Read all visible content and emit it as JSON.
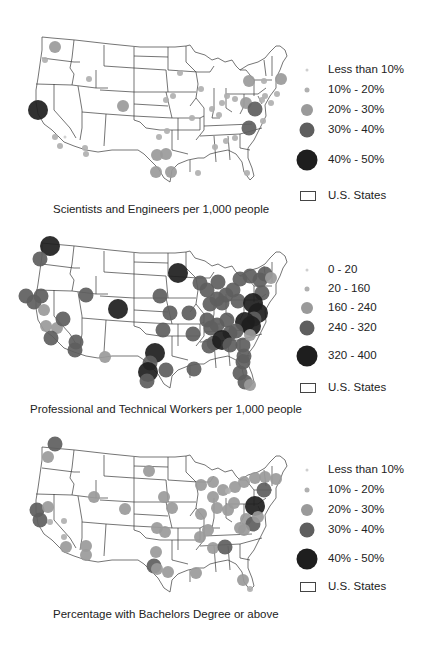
{
  "colors": {
    "state_line": "#3a3a3a",
    "level1": "#cfcfcf",
    "level2": "#b0b0b0",
    "level3": "#9a9a9a",
    "level4": "#5e5e5e",
    "level5": "#1e1e1e"
  },
  "panels": [
    {
      "caption": "Scientists and Engineers per 1,000 people",
      "legend": {
        "items": [
          {
            "label": "Less than 10%",
            "r": 1.5,
            "color": "#cfcfcf"
          },
          {
            "label": "10% - 20%",
            "r": 2.5,
            "color": "#b0b0b0"
          },
          {
            "label": "20% - 30%",
            "r": 6,
            "color": "#9a9a9a"
          },
          {
            "label": "30% - 40%",
            "r": 7.5,
            "color": "#5e5e5e"
          },
          {
            "label": "40% - 50%",
            "r": 10.5,
            "color": "#1e1e1e"
          }
        ],
        "states_label": "U.S. States"
      },
      "points": [
        [
          55,
          47,
          6,
          3
        ],
        [
          45,
          60,
          3,
          2
        ],
        [
          38,
          110,
          10,
          5
        ],
        [
          55,
          137,
          3,
          2
        ],
        [
          65,
          137,
          1.5,
          1
        ],
        [
          60,
          146,
          3,
          2
        ],
        [
          89,
          79,
          3,
          2
        ],
        [
          123,
          106,
          6,
          3
        ],
        [
          85,
          148,
          3,
          2
        ],
        [
          86,
          154,
          3,
          2
        ],
        [
          180,
          73,
          3,
          2
        ],
        [
          201,
          89,
          3,
          2
        ],
        [
          166,
          100,
          3,
          2
        ],
        [
          192,
          118,
          3,
          2
        ],
        [
          173,
          96,
          3,
          2
        ],
        [
          212,
          109,
          3,
          2
        ],
        [
          222,
          103,
          3,
          2
        ],
        [
          227,
          96,
          3,
          2
        ],
        [
          219,
          115,
          3,
          2
        ],
        [
          235,
          99,
          3,
          2
        ],
        [
          249,
          81,
          6,
          3
        ],
        [
          264,
          81,
          3,
          2
        ],
        [
          281,
          79,
          6,
          3
        ],
        [
          265,
          96,
          3,
          2
        ],
        [
          262,
          100,
          3,
          2
        ],
        [
          246,
          103,
          6,
          3
        ],
        [
          255,
          109,
          7.5,
          4
        ],
        [
          249,
          128,
          7.5,
          4
        ],
        [
          263,
          121,
          3,
          2
        ],
        [
          235,
          138,
          3,
          2
        ],
        [
          215,
          147,
          3,
          2
        ],
        [
          226,
          141,
          3,
          2
        ],
        [
          159,
          137,
          3,
          2
        ],
        [
          167,
          131,
          3,
          2
        ],
        [
          157,
          155,
          6,
          3
        ],
        [
          166,
          154,
          6,
          3
        ],
        [
          156,
          172,
          6,
          3
        ],
        [
          171,
          172,
          6,
          3
        ],
        [
          198,
          173,
          3,
          2
        ],
        [
          247,
          173,
          3,
          2
        ],
        [
          277,
          94,
          3,
          2
        ],
        [
          271,
          103,
          3,
          2
        ]
      ]
    },
    {
      "caption": "Professional and Technical Workers per 1,000 people",
      "legend": {
        "items": [
          {
            "label": "0 - 20",
            "r": 1.5,
            "color": "#cfcfcf"
          },
          {
            "label": "20 - 160",
            "r": 2.5,
            "color": "#b0b0b0"
          },
          {
            "label": "160 - 240",
            "r": 6,
            "color": "#9a9a9a"
          },
          {
            "label": "240 - 320",
            "r": 7.5,
            "color": "#5e5e5e"
          },
          {
            "label": "320 - 400",
            "r": 10.5,
            "color": "#1e1e1e"
          }
        ],
        "states_label": "U.S. States"
      },
      "points": [
        [
          50,
          246,
          10,
          5
        ],
        [
          40,
          259,
          7.5,
          4
        ],
        [
          26,
          296,
          7.5,
          4
        ],
        [
          34,
          302,
          7.5,
          4
        ],
        [
          41,
          296,
          7.5,
          4
        ],
        [
          44,
          310,
          6,
          3
        ],
        [
          46,
          326,
          6,
          3
        ],
        [
          57,
          328,
          6,
          3
        ],
        [
          51,
          338,
          7.5,
          4
        ],
        [
          63,
          319,
          7.5,
          4
        ],
        [
          76,
          342,
          7.5,
          4
        ],
        [
          75,
          350,
          7.5,
          4
        ],
        [
          86,
          295,
          7.5,
          4
        ],
        [
          105,
          357,
          6,
          3
        ],
        [
          118,
          309,
          10,
          5
        ],
        [
          178,
          273,
          10,
          5
        ],
        [
          160,
          296,
          7.5,
          4
        ],
        [
          170,
          313,
          7.5,
          4
        ],
        [
          189,
          313,
          7.5,
          4
        ],
        [
          193,
          334,
          7.5,
          4
        ],
        [
          163,
          330,
          7.5,
          4
        ],
        [
          155,
          353,
          10,
          5
        ],
        [
          150,
          363,
          7.5,
          4
        ],
        [
          148,
          372,
          10,
          5
        ],
        [
          147,
          381,
          7.5,
          4
        ],
        [
          166,
          370,
          7.5,
          4
        ],
        [
          194,
          369,
          7.5,
          4
        ],
        [
          200,
          283,
          7.5,
          4
        ],
        [
          207,
          290,
          7.5,
          4
        ],
        [
          218,
          282,
          7.5,
          4
        ],
        [
          217,
          299,
          7.5,
          4
        ],
        [
          210,
          304,
          7.5,
          4
        ],
        [
          222,
          303,
          7.5,
          4
        ],
        [
          226,
          295,
          7.5,
          4
        ],
        [
          233,
          290,
          7.5,
          4
        ],
        [
          238,
          301,
          7.5,
          4
        ],
        [
          207,
          320,
          7.5,
          4
        ],
        [
          217,
          325,
          7.5,
          4
        ],
        [
          227,
          320,
          7.5,
          4
        ],
        [
          230,
          333,
          7.5,
          4
        ],
        [
          211,
          328,
          7.5,
          4
        ],
        [
          214,
          343,
          7.5,
          4
        ],
        [
          209,
          346,
          7.5,
          4
        ],
        [
          222,
          340,
          10,
          5
        ],
        [
          230,
          345,
          7.5,
          4
        ],
        [
          243,
          345,
          7.5,
          4
        ],
        [
          240,
          279,
          7.5,
          4
        ],
        [
          250,
          276,
          7.5,
          4
        ],
        [
          260,
          280,
          7.5,
          4
        ],
        [
          265,
          274,
          7.5,
          4
        ],
        [
          271,
          278,
          6,
          3
        ],
        [
          262,
          293,
          7.5,
          4
        ],
        [
          253,
          303,
          10,
          5
        ],
        [
          258,
          313,
          10,
          5
        ],
        [
          254,
          319,
          7.5,
          4
        ],
        [
          245,
          322,
          10,
          5
        ],
        [
          251,
          326,
          10,
          5
        ],
        [
          236,
          331,
          7.5,
          4
        ],
        [
          250,
          335,
          6,
          3
        ],
        [
          243,
          362,
          7.5,
          4
        ],
        [
          240,
          373,
          7.5,
          4
        ],
        [
          245,
          382,
          7.5,
          4
        ],
        [
          250,
          385,
          6,
          3
        ],
        [
          244,
          356,
          7.5,
          4
        ]
      ]
    },
    {
      "caption": "Percentage with Bachelors Degree or above",
      "legend": {
        "items": [
          {
            "label": "Less than 10%",
            "r": 1.5,
            "color": "#cfcfcf"
          },
          {
            "label": "10% - 20%",
            "r": 2.5,
            "color": "#b0b0b0"
          },
          {
            "label": "20% - 30%",
            "r": 6,
            "color": "#9a9a9a"
          },
          {
            "label": "30% - 40%",
            "r": 7.5,
            "color": "#5e5e5e"
          },
          {
            "label": "40% - 50%",
            "r": 10.5,
            "color": "#1e1e1e"
          }
        ],
        "states_label": "U.S. States"
      },
      "points": [
        [
          55,
          444,
          7.5,
          4
        ],
        [
          48,
          457,
          6,
          3
        ],
        [
          37,
          510,
          7.5,
          4
        ],
        [
          40,
          520,
          7.5,
          4
        ],
        [
          48,
          507,
          6,
          3
        ],
        [
          50,
          522,
          3,
          2
        ],
        [
          64,
          521,
          3,
          2
        ],
        [
          64,
          537,
          3,
          2
        ],
        [
          66,
          547,
          6,
          3
        ],
        [
          86,
          546,
          6,
          3
        ],
        [
          86,
          555,
          6,
          3
        ],
        [
          94,
          497,
          6,
          3
        ],
        [
          125,
          509,
          6,
          3
        ],
        [
          149,
          471,
          6,
          3
        ],
        [
          164,
          497,
          6,
          3
        ],
        [
          172,
          508,
          6,
          3
        ],
        [
          157,
          528,
          6,
          3
        ],
        [
          165,
          532,
          6,
          3
        ],
        [
          156,
          552,
          6,
          3
        ],
        [
          154,
          566,
          7.5,
          4
        ],
        [
          157,
          569,
          6,
          3
        ],
        [
          168,
          572,
          6,
          3
        ],
        [
          196,
          573,
          6,
          3
        ],
        [
          201,
          514,
          6,
          3
        ],
        [
          200,
          537,
          6,
          3
        ],
        [
          213,
          497,
          6,
          3
        ],
        [
          213,
          482,
          6,
          3
        ],
        [
          201,
          485,
          6,
          3
        ],
        [
          223,
          490,
          6,
          3
        ],
        [
          235,
          487,
          6,
          3
        ],
        [
          217,
          508,
          6,
          3
        ],
        [
          234,
          503,
          6,
          3
        ],
        [
          228,
          510,
          6,
          3
        ],
        [
          246,
          519,
          6,
          3
        ],
        [
          208,
          530,
          6,
          3
        ],
        [
          240,
          528,
          6,
          3
        ],
        [
          213,
          548,
          6,
          3
        ],
        [
          225,
          547,
          7.5,
          4
        ],
        [
          244,
          482,
          6,
          3
        ],
        [
          255,
          478,
          6,
          3
        ],
        [
          265,
          477,
          6,
          3
        ],
        [
          264,
          490,
          7.5,
          4
        ],
        [
          276,
          479,
          6,
          3
        ],
        [
          255,
          506,
          10,
          5
        ],
        [
          253,
          524,
          7.5,
          4
        ],
        [
          258,
          517,
          6,
          3
        ],
        [
          244,
          530,
          6,
          3
        ],
        [
          243,
          580,
          6,
          3
        ],
        [
          250,
          589,
          3,
          2
        ],
        [
          228,
          491,
          3,
          2
        ]
      ]
    }
  ]
}
